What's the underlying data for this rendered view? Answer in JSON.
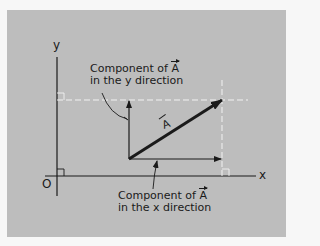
{
  "diagram": {
    "axes": {
      "x_label": "x",
      "y_label": "y",
      "origin_label": "O"
    },
    "vector": {
      "name": "A"
    },
    "labels": {
      "y_component_line1_prefix": "Component of ",
      "y_component_symbol": "A",
      "y_component_line2": "in the y direction",
      "x_component_line1_prefix": "Component of ",
      "x_component_symbol": "A",
      "x_component_line2": "in the x direction"
    },
    "colors": {
      "background": "#bdbdbd",
      "ink": "#1a1a1a",
      "dashed": "#f2f2f2"
    }
  }
}
